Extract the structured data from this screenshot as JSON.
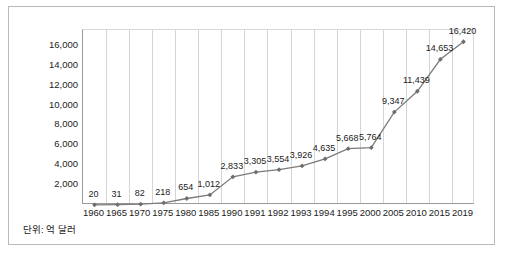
{
  "unit_note": "단위: 억 달러",
  "chart_data": {
    "type": "line",
    "title": "",
    "xlabel": "",
    "ylabel": "",
    "categories": [
      "1960",
      "1965",
      "1970",
      "1975",
      "1980",
      "1985",
      "1990",
      "1991",
      "1992",
      "1993",
      "1994",
      "1995",
      "2000",
      "2005",
      "2010",
      "2015",
      "2019"
    ],
    "values": [
      20,
      31,
      82,
      218,
      654,
      1012,
      2833,
      3305,
      3554,
      3926,
      4635,
      5668,
      5764,
      9347,
      11439,
      14653,
      16420
    ],
    "data_labels": [
      "20",
      "31",
      "82",
      "218",
      "654",
      "1,012",
      "2,833",
      "3,305",
      "3,554",
      "3,926",
      "4,635",
      "5,668",
      "5,764",
      "9,347",
      "11,439",
      "14,653",
      "16,420"
    ],
    "yticks": [
      0,
      2000,
      4000,
      6000,
      8000,
      10000,
      12000,
      14000,
      16000
    ],
    "ytick_labels": [
      "",
      "2,000",
      "4,000",
      "6,000",
      "8,000",
      "10,000",
      "12,000",
      "14,000",
      "16,000"
    ],
    "ylim": [
      0,
      17600
    ],
    "grid": "vertical",
    "legend": "none",
    "line_color": "#7b7b7b",
    "marker_color": "#6e6e6e"
  }
}
